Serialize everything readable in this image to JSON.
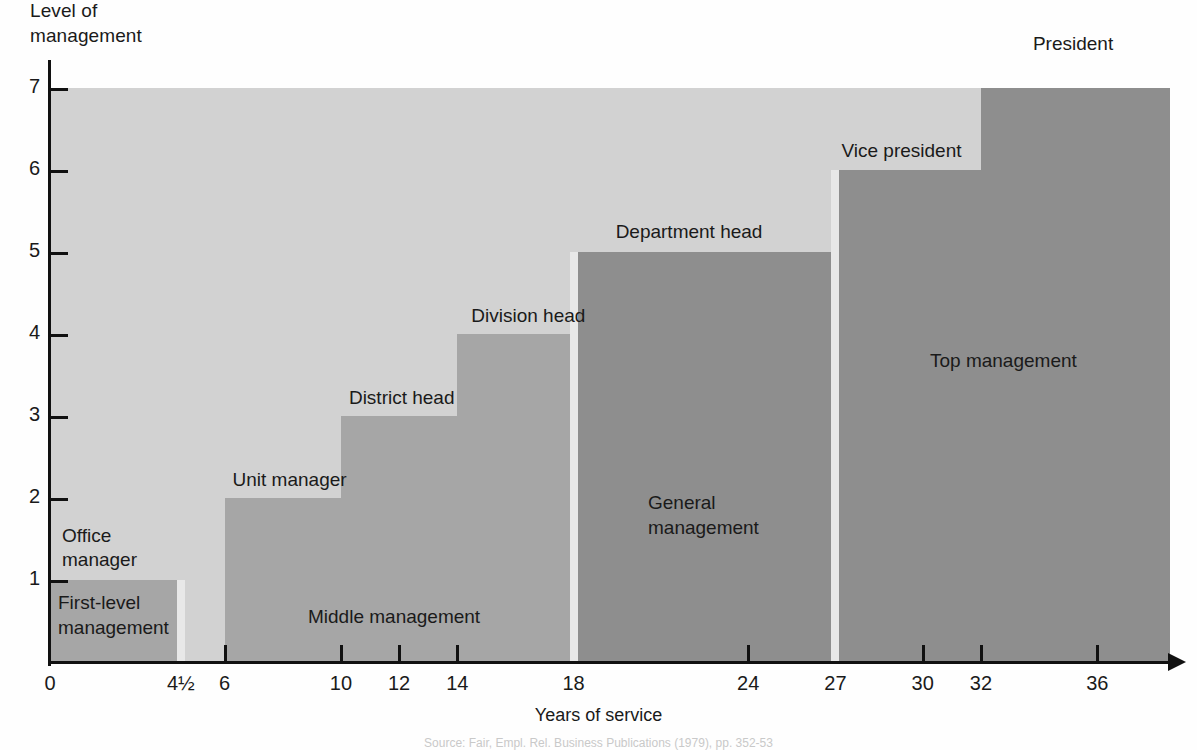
{
  "chart_data": {
    "type": "bar",
    "title": "",
    "xlabel": "Years of service",
    "ylabel": "Level of\nmanagement",
    "xlim": [
      0,
      38.5
    ],
    "ylim": [
      0,
      7.3
    ],
    "grid": false,
    "legend_position": "none",
    "xticks": [
      {
        "value": 0,
        "label": "0"
      },
      {
        "value": 4.5,
        "label": "4½"
      },
      {
        "value": 6,
        "label": "6"
      },
      {
        "value": 10,
        "label": "10"
      },
      {
        "value": 12,
        "label": "12"
      },
      {
        "value": 14,
        "label": "14"
      },
      {
        "value": 18,
        "label": "18"
      },
      {
        "value": 24,
        "label": "24"
      },
      {
        "value": 27,
        "label": "27"
      },
      {
        "value": 30,
        "label": "30"
      },
      {
        "value": 32,
        "label": "32"
      },
      {
        "value": 36,
        "label": "36"
      }
    ],
    "yticks": [
      {
        "value": 1,
        "label": "1"
      },
      {
        "value": 2,
        "label": "2"
      },
      {
        "value": 3,
        "label": "3"
      },
      {
        "value": 4,
        "label": "4"
      },
      {
        "value": 5,
        "label": "5"
      },
      {
        "value": 6,
        "label": "6"
      },
      {
        "value": 7,
        "label": "7"
      }
    ],
    "steps": [
      {
        "label": "Office\nmanager",
        "level": 1,
        "x_start": 0,
        "x_end": 4.5,
        "tier": "first-level"
      },
      {
        "label": "Unit manager",
        "level": 2,
        "x_start": 6,
        "x_end": 10,
        "tier": "middle"
      },
      {
        "label": "District head",
        "level": 3,
        "x_start": 10,
        "x_end": 14,
        "tier": "middle"
      },
      {
        "label": "Division head",
        "level": 4,
        "x_start": 14,
        "x_end": 18,
        "tier": "middle"
      },
      {
        "label": "Department head",
        "level": 5,
        "x_start": 18,
        "x_end": 27,
        "tier": "general"
      },
      {
        "label": "Vice president",
        "level": 6,
        "x_start": 27,
        "x_end": 32,
        "tier": "top"
      },
      {
        "label": "President",
        "level": 7,
        "x_start": 32,
        "x_end": 38.5,
        "tier": "top"
      }
    ],
    "tiers": [
      {
        "name": "First-level\nmanagement",
        "x_start": 0,
        "x_end": 4.5,
        "color": "#a6a6a6"
      },
      {
        "name": "Middle management",
        "x_start": 6,
        "x_end": 18,
        "color": "#a6a6a6"
      },
      {
        "name": "General\nmanagement",
        "x_start": 18,
        "x_end": 27,
        "color": "#8e8e8e"
      },
      {
        "name": "Top management",
        "x_start": 27,
        "x_end": 38.5,
        "color": "#8e8e8e"
      }
    ],
    "colors": {
      "background_light": "#d2d2d2",
      "tier_middle": "#a6a6a6",
      "tier_dark": "#8e8e8e",
      "axis": "#111111",
      "page": "#fefefe"
    }
  },
  "caption": "Source: Fair, Empl. Rel. Business Publications (1979), pp. 352-53"
}
